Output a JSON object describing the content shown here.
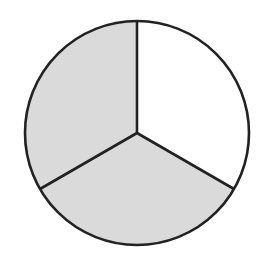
{
  "diagram": {
    "type": "fraction-circle",
    "total_parts": 3,
    "shaded_parts": 2,
    "fraction_shaded": "2/3",
    "center": [
      137,
      133
    ],
    "radius": 112,
    "colors": {
      "shaded": "#dadada",
      "unshaded": "#ffffff",
      "stroke": "#222222"
    },
    "sectors": [
      {
        "id": "top-right",
        "start_deg": -90,
        "end_deg": 30,
        "shaded": false
      },
      {
        "id": "bottom",
        "start_deg": 30,
        "end_deg": 150,
        "shaded": true
      },
      {
        "id": "top-left",
        "start_deg": 150,
        "end_deg": 270,
        "shaded": true
      }
    ]
  }
}
